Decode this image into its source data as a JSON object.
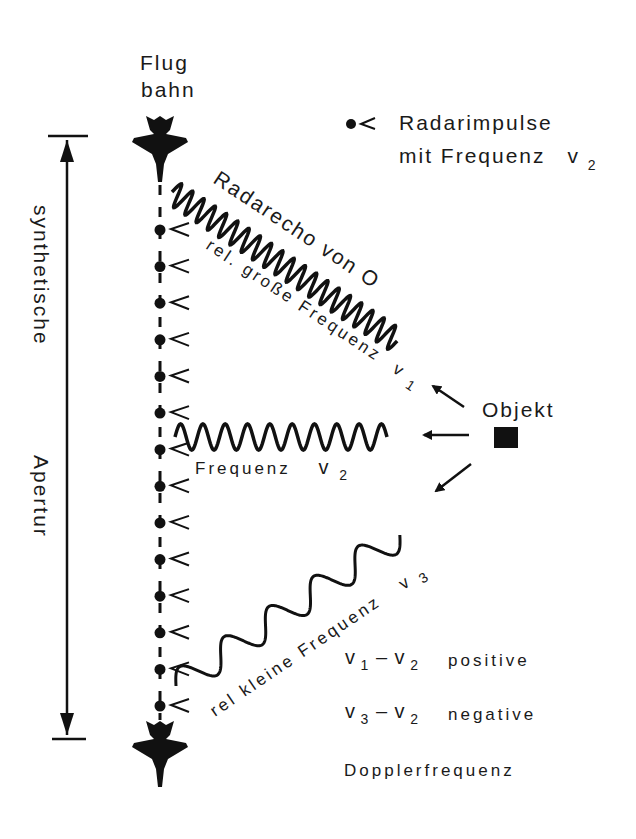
{
  "diagram": {
    "title_flightpath_line1": "Flug",
    "title_flightpath_line2": "bahn",
    "legend": {
      "symbol": "radar-pulse",
      "line1": "Radarimpulse",
      "line2_prefix": "mit  Frequenz",
      "line2_var": "v",
      "line2_sub": "2"
    },
    "aperture_label_part1": "synthetische",
    "aperture_label_part2": "Apertur",
    "echo_label": "Radarecho  von  O",
    "high_freq_label": "rel.  große  Frequenz",
    "high_freq_var": "v",
    "high_freq_sub": "1",
    "mid_freq_label": "Frequenz",
    "mid_freq_var": "v",
    "mid_freq_sub": "2",
    "low_freq_label": "rel   kleine   Frequenz",
    "low_freq_var": "v",
    "low_freq_sub": "3",
    "object_label": "Objekt",
    "doppler": {
      "row1_expr_a": "v",
      "row1_sub_a": "1",
      "row1_minus": "–",
      "row1_expr_b": "v",
      "row1_sub_b": "2",
      "row1_sign": "positive",
      "row2_expr_a": "v",
      "row2_sub_a": "3",
      "row2_minus": "–",
      "row2_expr_b": "v",
      "row2_sub_b": "2",
      "row2_sign": "negative",
      "footer": "Dopplerfrequenz"
    },
    "pulse_count": 14,
    "colors": {
      "ink": "#111111",
      "background": "#ffffff"
    }
  }
}
